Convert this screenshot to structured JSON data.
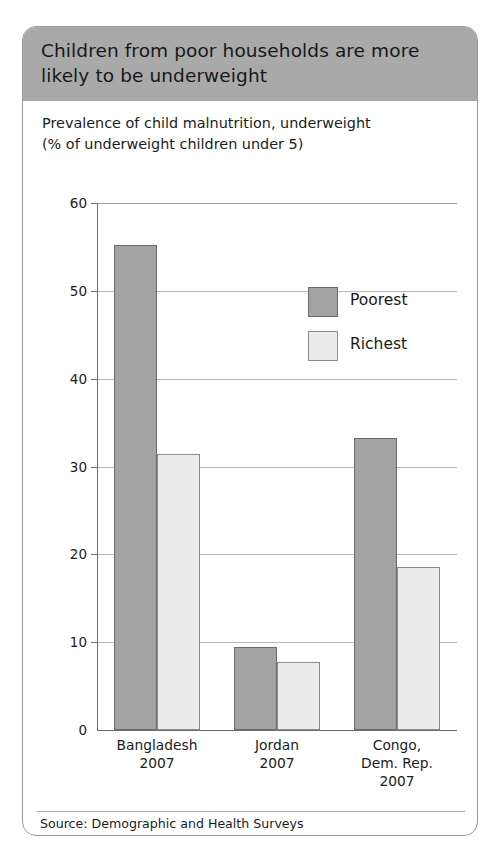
{
  "header": {
    "title": "Children from poor households are more likely to be underweight"
  },
  "subtitle": {
    "line1": "Prevalence of child malnutrition, underweight",
    "line2": "(% of underweight children under 5)"
  },
  "source": {
    "text": "Source: Demographic and Health Surveys"
  },
  "colors": {
    "header_band": "#a9a9a9",
    "poorest": "#a3a3a3",
    "poorest_border": "#6a6a6a",
    "richest": "#ececec",
    "richest_border": "#8a8a8a",
    "gridline": "#b9b9b9",
    "axis": "#6d6d6d",
    "card_border": "#9a9a9a"
  },
  "chart_data": {
    "type": "bar",
    "title": "Children from poor households are more likely to be underweight",
    "subtitle": "Prevalence of child malnutrition, underweight (% of underweight children under 5)",
    "xlabel": "",
    "ylabel": "",
    "ylim": [
      0,
      60
    ],
    "yticks": [
      0,
      10,
      20,
      30,
      40,
      50,
      60
    ],
    "ytick_labels": [
      "0",
      "10",
      "20",
      "30",
      "40",
      "50",
      "60"
    ],
    "grid": true,
    "legend_position": "upper right",
    "categories": [
      "Bangladesh",
      "Jordan",
      "Congo, Dem. Rep."
    ],
    "category_years": [
      "2007",
      "2007",
      "2007"
    ],
    "category_lines": [
      [
        "Bangladesh",
        "2007"
      ],
      [
        "Jordan",
        "2007"
      ],
      [
        "Congo,",
        "Dem. Rep.",
        "2007"
      ]
    ],
    "series": [
      {
        "name": "Poorest",
        "values": [
          55.2,
          9.5,
          33.3
        ]
      },
      {
        "name": "Richest",
        "values": [
          31.4,
          7.7,
          18.6
        ]
      }
    ]
  }
}
